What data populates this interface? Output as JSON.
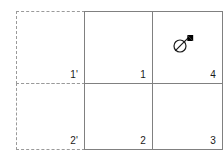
{
  "diagram": {
    "line_color_solid": "#808080",
    "line_color_dashed": "#9a9a9a",
    "label_color": "#1a1a1a",
    "background": "#ffffff"
  },
  "cells": {
    "top_left_ghost": {
      "label": "1'",
      "border": "dashed"
    },
    "bottom_left_ghost": {
      "label": "2'",
      "border": "dashed"
    },
    "top_middle": {
      "label": "1",
      "border": "solid"
    },
    "bottom_middle": {
      "label": "2",
      "border": "solid"
    },
    "top_right": {
      "label": "4",
      "border": "solid"
    },
    "bottom_right": {
      "label": "3",
      "border": "solid"
    }
  },
  "cursor": {
    "icon": "no-drop-cursor-icon",
    "located_in": "4",
    "arrow_color": "#000000",
    "ring_color": "#1a1a1a"
  }
}
